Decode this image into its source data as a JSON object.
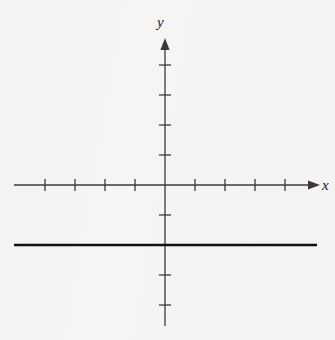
{
  "figure": {
    "background_color": "#f6f5f3",
    "width": 335,
    "height": 340
  },
  "labels": {
    "x_axis": "x",
    "y_axis": "y"
  },
  "chart_data": {
    "type": "line",
    "title": "",
    "subtitle": "",
    "xlabel": "x",
    "ylabel": "y",
    "grid": false,
    "legend": "none",
    "axes": {
      "x": {
        "label": "x",
        "xlim": [
          -5,
          5
        ],
        "tick_step": 1,
        "tick_values": [
          -4,
          -3,
          -2,
          -1,
          1,
          2,
          3,
          4
        ],
        "tick_labels": [],
        "arrow": "right",
        "origin_marked": true
      },
      "y": {
        "label": "y",
        "ylim": [
          -5,
          5
        ],
        "tick_step": 1,
        "tick_values": [
          -4,
          -3,
          -2,
          -1,
          1,
          2,
          3,
          4
        ],
        "tick_labels": [],
        "arrow": "up",
        "origin_marked": true
      }
    },
    "series": [
      {
        "name": "y = -2",
        "equation": "y = -2",
        "kind": "horizontal-line",
        "constant_y": -2,
        "x": [
          -5,
          5
        ],
        "values": [
          -2,
          -2
        ],
        "color": "#111111",
        "linewidth": 2.6,
        "style": "solid"
      }
    ],
    "annotations": []
  },
  "geometry": {
    "origin_x": 165,
    "origin_y": 185,
    "unit_px": 30,
    "x_axis_start_x": 14,
    "x_axis_end_x": 311,
    "y_axis_top_y": 47,
    "y_axis_bottom_y": 326,
    "tick_half_length": 6,
    "graph_line_y": 245,
    "graph_line_x_start": 14,
    "graph_line_x_end": 317,
    "axis_color": "#3a3a3a",
    "graph_line_color": "#111111"
  }
}
